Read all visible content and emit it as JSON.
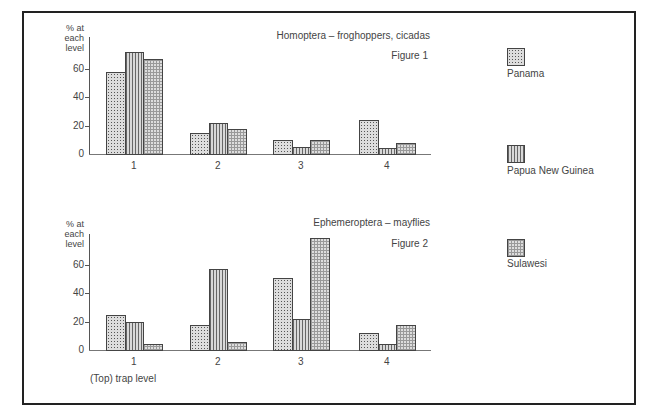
{
  "chart_data": [
    {
      "type": "bar",
      "title": "Homoptera – froghoppers, cicadas",
      "subtitle": "Figure 1",
      "xlabel": "",
      "ylabel": "% at each level",
      "categories": [
        "1",
        "2",
        "3",
        "4"
      ],
      "yticks": [
        0,
        20,
        40,
        60
      ],
      "ylim": [
        0,
        80
      ],
      "grid": false,
      "legend_position": "right",
      "series": [
        {
          "name": "Panama",
          "values": [
            58,
            15,
            10,
            24
          ]
        },
        {
          "name": "Papua New Guinea",
          "values": [
            72,
            22,
            5,
            4
          ]
        },
        {
          "name": "Sulawesi",
          "values": [
            67,
            18,
            10,
            8
          ]
        }
      ]
    },
    {
      "type": "bar",
      "title": "Ephemeroptera – mayflies",
      "subtitle": "Figure 2",
      "xlabel": "(Top) trap level",
      "ylabel": "% at each level",
      "categories": [
        "1",
        "2",
        "3",
        "4"
      ],
      "yticks": [
        0,
        20,
        40,
        60
      ],
      "ylim": [
        0,
        80
      ],
      "grid": false,
      "legend_position": "right",
      "series": [
        {
          "name": "Panama",
          "values": [
            25,
            18,
            51,
            12
          ]
        },
        {
          "name": "Papua New Guinea",
          "values": [
            20,
            57,
            22,
            4
          ]
        },
        {
          "name": "Sulawesi",
          "values": [
            4,
            6,
            79,
            18
          ]
        }
      ]
    }
  ],
  "figures": [
    {
      "title": "Homoptera – froghoppers, cicadas",
      "label": "Figure 1",
      "ylabel_lines": [
        "% at",
        "each",
        "level"
      ],
      "ticks": [
        "0",
        "20",
        "40",
        "60"
      ],
      "xticks": [
        "1",
        "2",
        "3",
        "4"
      ],
      "xlabel": ""
    },
    {
      "title": "Ephemeroptera – mayflies",
      "label": "Figure 2",
      "ylabel_lines": [
        "% at",
        "each",
        "level"
      ],
      "ticks": [
        "0",
        "20",
        "40",
        "60"
      ],
      "xticks": [
        "1",
        "2",
        "3",
        "4"
      ],
      "xlabel": "(Top) trap level"
    }
  ],
  "legend": [
    {
      "name": "Panama",
      "pattern": "dotted"
    },
    {
      "name": "Papua New Guinea",
      "pattern": "vertical-lines"
    },
    {
      "name": "Sulawesi",
      "pattern": "grid"
    }
  ]
}
